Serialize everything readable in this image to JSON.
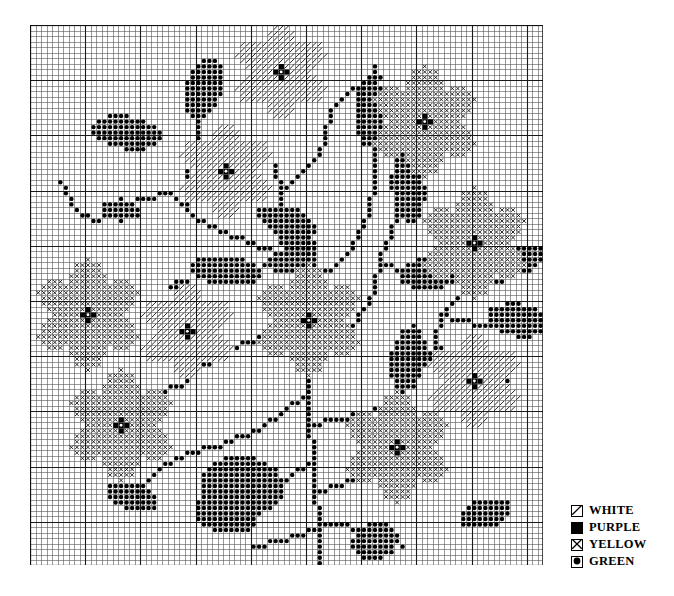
{
  "chart_data": {
    "type": "heatmap",
    "title": "",
    "subtitle": "",
    "xlabel": "",
    "ylabel": "",
    "grid": true,
    "grid_cols": 93,
    "grid_rows": 98,
    "cell_px": 5.52,
    "heavy_line_every": 10,
    "grid_line_color": "#555555",
    "heavy_line_color": "#1a1a1a",
    "background": "#ffffff",
    "symbol_colors": {
      "white": "#000000",
      "purple": "#000000",
      "yellow": "#000000",
      "green": "#000000"
    },
    "legend_position": "bottom-right",
    "legend": [
      {
        "symbol": "diagonal-slash-square",
        "label": "WHITE"
      },
      {
        "symbol": "filled-square",
        "label": "PURPLE"
      },
      {
        "symbol": "x-cross-square",
        "label": "YELLOW"
      },
      {
        "symbol": "dot-square",
        "label": "GREEN"
      }
    ],
    "motif": "floral spray / flowering tree",
    "stitch_counts": {
      "green": 1180,
      "yellow": 760,
      "white": 430,
      "purple": 60
    },
    "elements": [
      {
        "kind": "flower",
        "color": "yellow",
        "center_color": "purple",
        "cx": 71,
        "cy": 17,
        "radius": 9
      },
      {
        "kind": "flower",
        "color": "yellow",
        "center_color": "purple",
        "cx": 80,
        "cy": 39,
        "radius": 9
      },
      {
        "kind": "flower",
        "color": "yellow",
        "center_color": "purple",
        "cx": 10,
        "cy": 52,
        "radius": 9
      },
      {
        "kind": "flower",
        "color": "yellow",
        "center_color": "purple",
        "cx": 50,
        "cy": 53,
        "radius": 9
      },
      {
        "kind": "flower",
        "color": "yellow",
        "center_color": "purple",
        "cx": 16,
        "cy": 72,
        "radius": 9
      },
      {
        "kind": "flower",
        "color": "yellow",
        "center_color": "purple",
        "cx": 66,
        "cy": 76,
        "radius": 9
      },
      {
        "kind": "flower",
        "color": "white",
        "center_color": "purple",
        "cx": 45,
        "cy": 8,
        "radius": 8
      },
      {
        "kind": "flower",
        "color": "white",
        "center_color": "purple",
        "cx": 35,
        "cy": 26,
        "radius": 8
      },
      {
        "kind": "flower",
        "color": "white",
        "center_color": "purple",
        "cx": 28,
        "cy": 55,
        "radius": 8
      },
      {
        "kind": "flower",
        "color": "white",
        "center_color": "purple",
        "cx": 80,
        "cy": 64,
        "radius": 8
      }
    ]
  },
  "legend_block": {
    "rows": [
      {
        "symbol": "diagonal-slash-square",
        "label": "WHITE"
      },
      {
        "symbol": "filled-square",
        "label": "PURPLE"
      },
      {
        "symbol": "x-cross-square",
        "label": "YELLOW"
      },
      {
        "symbol": "dot-square",
        "label": "GREEN"
      }
    ]
  }
}
